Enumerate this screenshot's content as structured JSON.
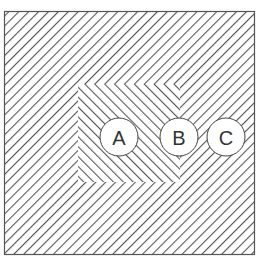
{
  "figure": {
    "type": "optical-illusion-line-pattern",
    "frame": {
      "x": 4,
      "y": 11,
      "width": 251,
      "height": 244,
      "stroke": "#555555"
    },
    "background_hatch": {
      "direction": "backslash",
      "spacing": 7,
      "stroke": "#555555"
    },
    "inner_region": {
      "x": 78,
      "y": 84,
      "width": 102,
      "height": 98,
      "direction": "slash",
      "spacing": 7
    },
    "circles": [
      {
        "id": "A",
        "label": "A",
        "cx": 119,
        "cy": 137,
        "r": 19
      },
      {
        "id": "B",
        "label": "B",
        "cx": 179,
        "cy": 137,
        "r": 19
      },
      {
        "id": "C",
        "label": "C",
        "cx": 226,
        "cy": 137,
        "r": 19
      }
    ]
  }
}
